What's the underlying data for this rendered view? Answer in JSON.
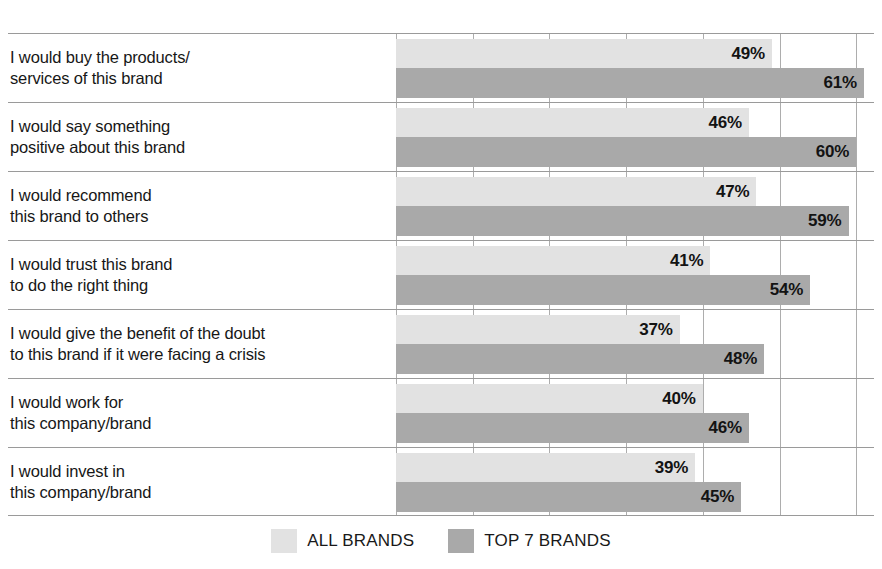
{
  "chart_data": {
    "type": "bar",
    "orientation": "horizontal",
    "title": "",
    "xlabel": "",
    "ylabel": "",
    "xlim": [
      0,
      70
    ],
    "grid": true,
    "grid_interval": 10,
    "value_suffix": "%",
    "legend_position": "bottom-center",
    "categories": [
      "I would buy the products/\nservices of this brand",
      "I would say something\npositive about this brand",
      "I would recommend\nthis brand to others",
      "I would trust this brand\nto do the right thing",
      "I would give the benefit of the doubt\nto this brand if it were facing a crisis",
      "I would work for\nthis company/brand",
      "I would invest in\nthis company/brand"
    ],
    "series": [
      {
        "name": "ALL BRANDS",
        "color": "#e2e2e2",
        "values": [
          49,
          46,
          47,
          41,
          37,
          40,
          39
        ],
        "labels": [
          "49%",
          "46%",
          "47%",
          "41%",
          "37%",
          "40%",
          "39%"
        ]
      },
      {
        "name": "TOP 7 BRANDS",
        "color": "#a9a9a9",
        "values": [
          61,
          60,
          59,
          54,
          48,
          46,
          45
        ],
        "labels": [
          "61%",
          "60%",
          "59%",
          "54%",
          "48%",
          "46%",
          "45%"
        ]
      }
    ]
  },
  "rows": [
    {
      "label": "I would buy the products/\nservices of this brand",
      "all_brands": {
        "value": 49,
        "label": "49%"
      },
      "top7_brands": {
        "value": 61,
        "label": "61%"
      }
    },
    {
      "label": "I would say something\npositive about this brand",
      "all_brands": {
        "value": 46,
        "label": "46%"
      },
      "top7_brands": {
        "value": 60,
        "label": "60%"
      }
    },
    {
      "label": "I would recommend\nthis brand to others",
      "all_brands": {
        "value": 47,
        "label": "47%"
      },
      "top7_brands": {
        "value": 59,
        "label": "59%"
      }
    },
    {
      "label": "I would trust this brand\nto do the right thing",
      "all_brands": {
        "value": 41,
        "label": "41%"
      },
      "top7_brands": {
        "value": 54,
        "label": "54%"
      }
    },
    {
      "label": "I would give the benefit of the doubt\nto this brand if it were facing a crisis",
      "all_brands": {
        "value": 37,
        "label": "37%"
      },
      "top7_brands": {
        "value": 48,
        "label": "48%"
      }
    },
    {
      "label": "I would work for\nthis company/brand",
      "all_brands": {
        "value": 40,
        "label": "40%"
      },
      "top7_brands": {
        "value": 46,
        "label": "46%"
      }
    },
    {
      "label": "I would invest in\nthis company/brand",
      "all_brands": {
        "value": 39,
        "label": "39%"
      },
      "top7_brands": {
        "value": 45,
        "label": "45%"
      }
    }
  ],
  "legend": {
    "items": [
      {
        "label": "ALL BRANDS",
        "color": "#e2e2e2"
      },
      {
        "label": "TOP 7 BRANDS",
        "color": "#a9a9a9"
      }
    ]
  },
  "axis": {
    "max": 70,
    "tick_interval": 10,
    "tick_count": 7
  },
  "colors": {
    "light_bar": "#e2e2e2",
    "dark_bar": "#a9a9a9",
    "grid": "#adadad",
    "row_rule": "#9a9a9a",
    "text": "#171717",
    "background": "#ffffff"
  }
}
